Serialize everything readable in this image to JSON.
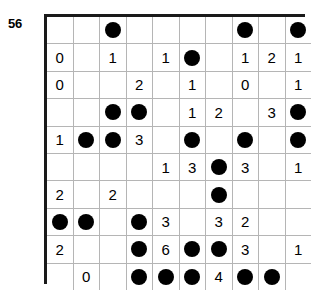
{
  "puzzle": {
    "label": "56",
    "columns": 10,
    "rows": 10,
    "dot_symbol": "filled-circle",
    "colors": {
      "background": "#ffffff",
      "border": "#1a1a1a",
      "gridline": "#b5b5b5",
      "dot": "#000000",
      "digit": "#000000"
    },
    "cells": [
      [
        "",
        "",
        "dot",
        "",
        "",
        "",
        "",
        "dot",
        "",
        "dot"
      ],
      [
        "0",
        "",
        "1",
        "",
        "1",
        "dot",
        "",
        "1",
        "2",
        "1"
      ],
      [
        "0",
        "",
        "",
        "2",
        "",
        "1",
        "",
        "0",
        "",
        "1"
      ],
      [
        "",
        "",
        "dot",
        "dot",
        "",
        "1",
        "2",
        "",
        "3",
        "dot"
      ],
      [
        "1",
        "dot",
        "dot",
        "3",
        "",
        "dot",
        "",
        "dot",
        "",
        "dot"
      ],
      [
        "",
        "",
        "",
        "",
        "1",
        "3",
        "dot",
        "3",
        "",
        "1"
      ],
      [
        "2",
        "",
        "2",
        "",
        "",
        "",
        "dot",
        "",
        "",
        ""
      ],
      [
        "dot",
        "dot",
        "",
        "dot",
        "3",
        "",
        "3",
        "2",
        "",
        ""
      ],
      [
        "2",
        "",
        "",
        "dot",
        "6",
        "dot",
        "dot",
        "3",
        "",
        "1"
      ],
      [
        "",
        "0",
        "",
        "dot",
        "dot",
        "dot",
        "4",
        "dot",
        "dot",
        ""
      ]
    ]
  }
}
